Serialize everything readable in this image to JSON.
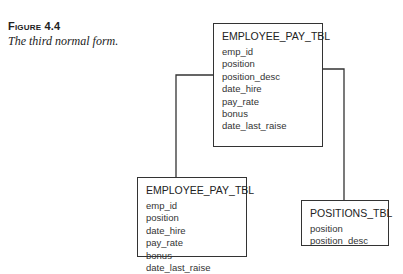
{
  "figure": {
    "label": "Figure 4.4",
    "caption": "The third normal form."
  },
  "tables": {
    "top": {
      "name": "EMPLOYEE_PAY_TBL",
      "fields": [
        "emp_id",
        "position",
        "position_desc",
        "date_hire",
        "pay_rate",
        "bonus",
        "date_last_raise"
      ]
    },
    "bottom": {
      "name": "EMPLOYEE_PAY_TBL",
      "fields": [
        "emp_id",
        "position",
        "date_hire",
        "pay_rate",
        "bonus",
        "date_last_raise"
      ]
    },
    "positions": {
      "name": "POSITIONS_TBL",
      "fields": [
        "position",
        "position_desc"
      ]
    }
  },
  "connectors": [
    {
      "from": "top",
      "to": "bottom",
      "description": "left connector"
    },
    {
      "from": "top.position..position_desc",
      "to": "positions",
      "description": "bracket connector"
    }
  ],
  "colors": {
    "line": "#333333",
    "background": "#ffffff"
  }
}
